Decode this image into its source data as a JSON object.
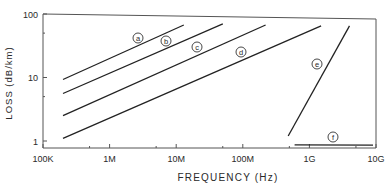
{
  "chart_data": {
    "type": "line",
    "title": "",
    "xlabel": "FREQUENCY (Hz)",
    "ylabel": "LOSS (dB/km)",
    "xscale": "log",
    "yscale": "log",
    "xlim": [
      100000,
      10000000000
    ],
    "ylim": [
      0.8,
      100
    ],
    "x_ticks": [
      {
        "value": 100000,
        "label": "100K"
      },
      {
        "value": 1000000,
        "label": "1M"
      },
      {
        "value": 10000000,
        "label": "10M"
      },
      {
        "value": 100000000,
        "label": "100M"
      },
      {
        "value": 1000000000,
        "label": "1G"
      },
      {
        "value": 10000000000,
        "label": "10G"
      }
    ],
    "y_ticks": [
      {
        "value": 1,
        "label": "1"
      },
      {
        "value": 10,
        "label": "10"
      },
      {
        "value": 100,
        "label": "100"
      }
    ],
    "grid": false,
    "legend": "inline circled letter labels",
    "series": [
      {
        "name": "a",
        "x": [
          200000,
          13000000
        ],
        "y": [
          9.3,
          67
        ]
      },
      {
        "name": "b",
        "x": [
          200000,
          50000000
        ],
        "y": [
          5.6,
          70
        ]
      },
      {
        "name": "c",
        "x": [
          200000,
          220000000
        ],
        "y": [
          2.5,
          67
        ]
      },
      {
        "name": "d",
        "x": [
          200000,
          1500000000
        ],
        "y": [
          1.1,
          65
        ]
      },
      {
        "name": "e",
        "x": [
          480000000,
          4000000000
        ],
        "y": [
          1.2,
          65
        ]
      },
      {
        "name": "f",
        "x": [
          600000000,
          9000000000
        ],
        "y": [
          0.87,
          0.86
        ]
      }
    ]
  }
}
